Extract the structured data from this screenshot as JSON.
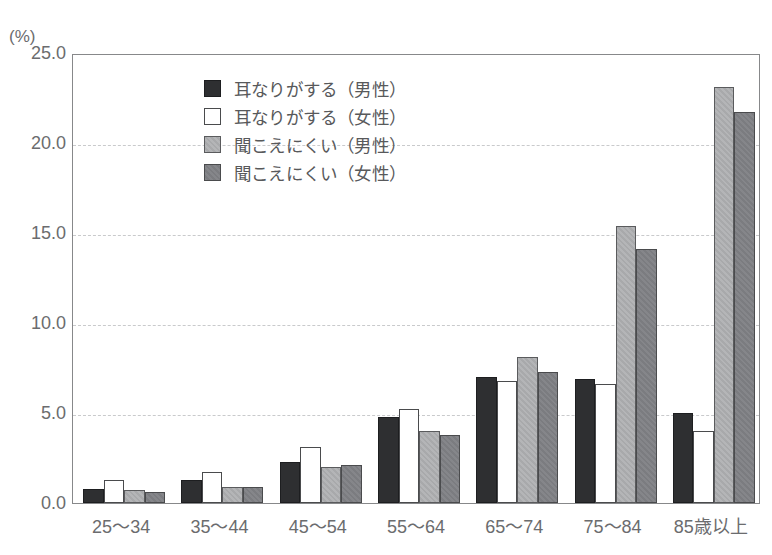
{
  "chart_data": {
    "type": "bar",
    "title": "",
    "subtitle": "",
    "xlabel": "",
    "ylabel": "",
    "unit_label": "(%)",
    "categories": [
      "25〜34",
      "35〜44",
      "45〜54",
      "55〜64",
      "65〜74",
      "75〜84",
      "85歳以上"
    ],
    "series": [
      {
        "name": "耳なりがする（男性）",
        "swatch": "black-solid",
        "color": "#2e2f31",
        "values": [
          0.8,
          1.3,
          2.3,
          4.8,
          7.0,
          6.9,
          5.0
        ]
      },
      {
        "name": "耳なりがする（女性）",
        "swatch": "white-outline",
        "color": "#ffffff",
        "values": [
          1.3,
          1.7,
          3.1,
          5.2,
          6.8,
          6.6,
          4.0
        ]
      },
      {
        "name": "聞こえにくい（男性）",
        "swatch": "light-gray-hatch",
        "color": "#b0b1b3",
        "values": [
          0.7,
          0.9,
          2.0,
          4.0,
          8.1,
          15.4,
          23.1
        ]
      },
      {
        "name": "聞こえにくい（女性）",
        "swatch": "dark-gray-hatch",
        "color": "#808184",
        "values": [
          0.6,
          0.9,
          2.1,
          3.8,
          7.3,
          14.1,
          21.7
        ]
      }
    ],
    "ylim": [
      0.0,
      25.0
    ],
    "ytick_labels": [
      "0.0",
      "5.0",
      "10.0",
      "15.0",
      "20.0",
      "25.0"
    ],
    "ytick_values": [
      0.0,
      5.0,
      10.0,
      15.0,
      20.0,
      25.0
    ],
    "grid": "horizontal-dashed",
    "legend_position": "inside-top-center"
  },
  "legend": {
    "entries": [
      {
        "label": "耳なりがする（男性）"
      },
      {
        "label": "耳なりがする（女性）"
      },
      {
        "label": "聞こえにくい（男性）"
      },
      {
        "label": "聞こえにくい（女性）"
      }
    ]
  }
}
